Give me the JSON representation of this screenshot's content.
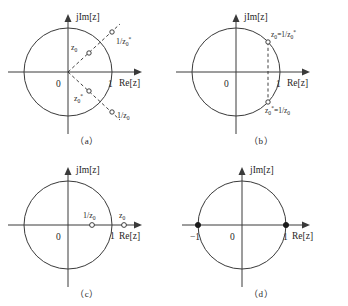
{
  "figure": {
    "background_color": "#ffffff",
    "line_color": "#3a3a3a",
    "text_color": "#262626",
    "axis_labels": {
      "imaginary": "jIm[z]",
      "real": "Re[z]"
    },
    "origin_label": "0",
    "unit_label": "1",
    "negative_unit_label": "−1"
  },
  "panels": [
    {
      "id": "a",
      "caption": "（a）",
      "description": "Unit circle with z0 inside, conjugate z0* inside, and reciprocals 1/z0* and 1/z0 outside along dashed radial rays",
      "origin_label": "0",
      "unit_label": "1",
      "imaginary_axis_label": "jIm[z]",
      "real_axis_label": "Re[z]",
      "points": [
        {
          "name": "z0",
          "label": "z₀",
          "marker": "open",
          "location": "inside-upper-right"
        },
        {
          "name": "1/z0*",
          "label": "1/z₀*",
          "marker": "open",
          "location": "outside-upper-right"
        },
        {
          "name": "z0*",
          "label": "z₀*",
          "marker": "open",
          "location": "inside-lower-right"
        },
        {
          "name": "1/z0",
          "label": "1/z₀",
          "marker": "open",
          "location": "outside-lower-right"
        }
      ]
    },
    {
      "id": "b",
      "caption": "（b）",
      "description": "Unit circle with conjugate pair lying exactly on the circle, joined by a dashed vertical chord",
      "origin_label": "0",
      "unit_label": "1",
      "imaginary_axis_label": "jIm[z]",
      "real_axis_label": "Re[z]",
      "points": [
        {
          "name": "z0",
          "label": "z₀=1/z₀*",
          "marker": "open",
          "location": "on-circle-upper-right"
        },
        {
          "name": "z0*",
          "label": "z₀*=1/z₀",
          "marker": "open",
          "location": "on-circle-lower-right"
        }
      ]
    },
    {
      "id": "c",
      "caption": "（c）",
      "description": "Unit circle with a real point z0 outside on the positive real axis and its reciprocal 1/z0 inside",
      "origin_label": "0",
      "unit_label": "1",
      "imaginary_axis_label": "jIm[z]",
      "real_axis_label": "Re[z]",
      "points": [
        {
          "name": "1/z0",
          "label": "1/z₀",
          "marker": "open",
          "location": "inside-real-axis"
        },
        {
          "name": "z0",
          "label": "z₀",
          "marker": "open",
          "location": "outside-real-axis"
        }
      ]
    },
    {
      "id": "d",
      "caption": "（d）",
      "description": "Unit circle with filled points at minus one and plus one on the real axis",
      "origin_label": "0",
      "unit_label": "1",
      "negative_unit_label": "−1",
      "imaginary_axis_label": "jIm[z]",
      "real_axis_label": "Re[z]",
      "points": [
        {
          "name": "minus-one",
          "label": "−1",
          "marker": "filled",
          "location": "on-circle-left-real-axis"
        },
        {
          "name": "plus-one",
          "label": "1",
          "marker": "filled",
          "location": "on-circle-right-real-axis"
        }
      ]
    }
  ]
}
